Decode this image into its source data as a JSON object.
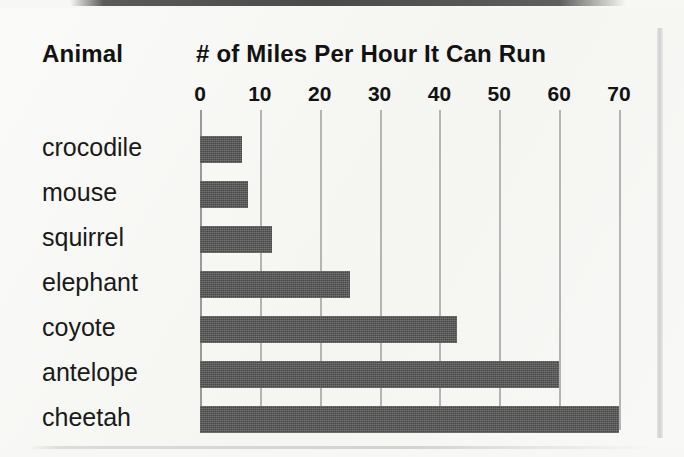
{
  "page": {
    "background_color": "#f7f7f5",
    "bar_color": "#565656",
    "gridline_color": "#b4b4b4",
    "text_color": "#121212"
  },
  "headers": {
    "animal": "Animal",
    "measure": "# of Miles Per Hour It Can Run"
  },
  "chart_data": {
    "type": "bar",
    "orientation": "horizontal",
    "title": "# of Miles Per Hour It Can Run",
    "xlabel": "# of Miles Per Hour It Can Run",
    "ylabel": "Animal",
    "categories": [
      "crocodile",
      "mouse",
      "squirrel",
      "elephant",
      "coyote",
      "antelope",
      "cheetah"
    ],
    "values": [
      7,
      8,
      12,
      25,
      43,
      60,
      70
    ],
    "xlim": [
      0,
      70
    ],
    "xticks": [
      0,
      10,
      20,
      30,
      40,
      50,
      60,
      70
    ],
    "xtick_labels": [
      "0",
      "10",
      "20",
      "30",
      "40",
      "50",
      "60",
      "70"
    ],
    "grid": true,
    "legend": null
  }
}
